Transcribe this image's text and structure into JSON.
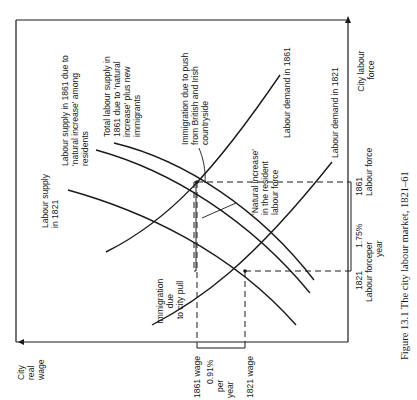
{
  "figure": {
    "caption": "Figure 13.1  The city labour market, 1821–61",
    "caption_fragment": "Source: see text"
  },
  "axes": {
    "y_axis_label": [
      "City",
      "real",
      "wage"
    ],
    "x_axis_label": [
      "City labour",
      "force"
    ]
  },
  "wage_axis": {
    "wage_1861": "1861 wage",
    "wage_1821": "1821 wage",
    "growth": [
      "0.91%",
      "per",
      "year"
    ]
  },
  "labour_axis": {
    "lf_1861": [
      "1861",
      "Labour force"
    ],
    "lf_1821": [
      "1821",
      "Labour force"
    ],
    "growth": [
      "1.75%",
      "per",
      "year"
    ]
  },
  "curves": {
    "supply_1821": [
      "Labour supply",
      "in 1821"
    ],
    "supply_1861_natural": [
      "Labour supply in 1861 due to",
      "'natural increase' among",
      "residents"
    ],
    "supply_1861_total": [
      "Total labour supply in",
      "1861 due to 'natural",
      "increase' plus new",
      "immigrants"
    ],
    "demand_1861": "Labour demand in 1861",
    "demand_1821": "Labour demand in 1821"
  },
  "annotations": {
    "push": [
      "Immigration due to push",
      "from British and Irish",
      "countryside"
    ],
    "natural_increase": [
      "'Natural increase'",
      "in the resident",
      "labour force"
    ],
    "pull": [
      "Immigration",
      "due",
      "to city pull"
    ]
  },
  "colors": {
    "ink": "#1a1a1a",
    "paper": "#ffffff"
  }
}
